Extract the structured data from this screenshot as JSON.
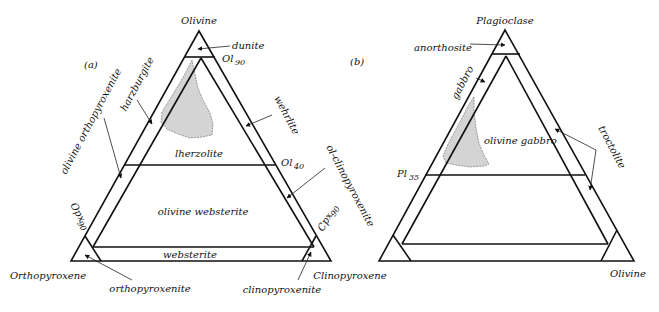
{
  "diagram_a": {
    "panel_label": "(a)",
    "vertices": {
      "top": "Olivine",
      "bottom_left": "Orthopyroxene",
      "bottom_right": "Clinopyroxene"
    },
    "boundary_labels": {
      "ol90": "Ol",
      "ol90_sub": "90",
      "ol40": "Ol",
      "ol40_sub": "40",
      "opx90": "Opx",
      "opx90_sub": "90",
      "cpx90": "Cpx",
      "cpx90_sub": "90"
    },
    "fields": {
      "dunite": "dunite",
      "harzburgite": "harzburgite",
      "wehrlite": "wehrlite",
      "lherzolite": "lherzolite",
      "olivine_orthopyroxenite": "olivine orthopyroxenite",
      "ol_clinopyroxenite": "ol-clinopyroxenite",
      "olivine_websterite": "olivine websterite",
      "websterite": "websterite",
      "orthopyroxenite": "orthopyroxenite",
      "clinopyroxenite": "clinopyroxenite"
    }
  },
  "diagram_b": {
    "panel_label": "(b)",
    "vertices": {
      "top": "Plagioclase",
      "bottom_left": "Clinopyroxene",
      "bottom_right": "Olivine"
    },
    "boundary_labels": {
      "pl35": "Pl",
      "pl35_sub": "35"
    },
    "fields": {
      "anorthosite": "anorthosite",
      "gabbro": "gabbro",
      "olivine_gabbro": "olivine gabbro",
      "troctolite": "troctolite"
    }
  },
  "colors": {
    "line": "#111111",
    "shaded_region": "#d4d4d4",
    "background": "#ffffff"
  }
}
